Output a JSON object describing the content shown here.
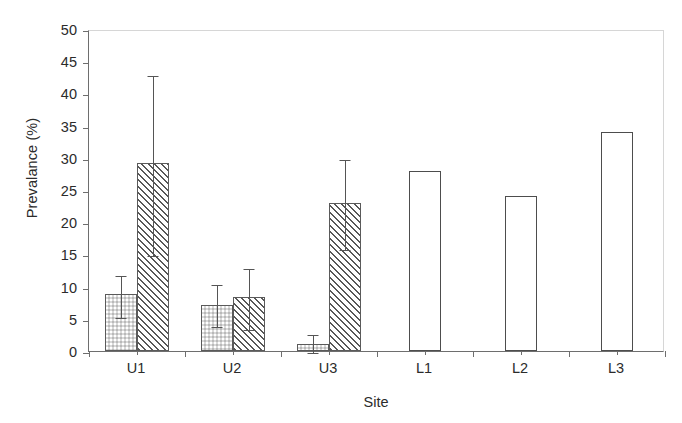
{
  "chart_data": {
    "type": "bar",
    "title": "",
    "xlabel": "Site",
    "ylabel": "Prevalance (%)",
    "ylim": [
      0,
      50
    ],
    "ytick_step": 5,
    "yticks": [
      0,
      5,
      10,
      15,
      20,
      25,
      30,
      35,
      40,
      45,
      50
    ],
    "grid": false,
    "legend": "none",
    "categories": [
      "U1",
      "U2",
      "U3",
      "L1",
      "L2",
      "L3"
    ],
    "series": [
      {
        "name": "series-1-dotted",
        "fill": "stippled-gray",
        "values": [
          8.8,
          7.1,
          1.1,
          null,
          null,
          null
        ],
        "err_low": [
          5.5,
          4.0,
          0.0,
          null,
          null,
          null
        ],
        "err_high": [
          12.0,
          10.5,
          2.8,
          null,
          null,
          null
        ]
      },
      {
        "name": "series-2-hatched",
        "fill": "diagonal-hatch",
        "values": [
          29.2,
          8.4,
          23.0,
          null,
          null,
          null
        ],
        "err_low": [
          15.0,
          3.5,
          16.0,
          null,
          null,
          null
        ],
        "err_high": [
          43.0,
          13.0,
          30.0,
          null,
          null,
          null
        ]
      },
      {
        "name": "series-3-open",
        "fill": "white-open",
        "values": [
          null,
          null,
          null,
          28.0,
          24.0,
          34.0
        ],
        "err_low": [
          null,
          null,
          null,
          null,
          null,
          null
        ],
        "err_high": [
          null,
          null,
          null,
          null,
          null,
          null
        ]
      }
    ]
  },
  "axes": {
    "y_tick_labels": [
      "0",
      "5",
      "10",
      "15",
      "20",
      "25",
      "30",
      "35",
      "40",
      "45",
      "50"
    ],
    "x_tick_labels": [
      "U1",
      "U2",
      "U3",
      "L1",
      "L2",
      "L3"
    ],
    "y_axis_title": "Prevalance (%)",
    "x_axis_title": "Site"
  },
  "colors": {
    "axis": "#6e6e6e",
    "frame_light": "#d6d6d6",
    "bar_outline": "#5a5a5a",
    "hatch": "#585858",
    "dot_fill": "#d9d9d9",
    "error_bar": "#555555",
    "text": "#2b2b2b",
    "background": "#ffffff"
  }
}
